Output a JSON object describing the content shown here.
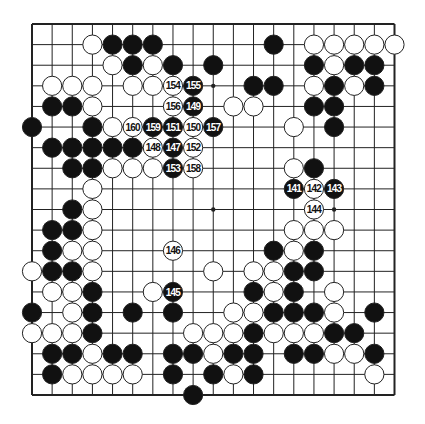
{
  "diagram": {
    "type": "go-board",
    "size": 19,
    "colors": {
      "board": "#ffffff",
      "line": "#222222",
      "black": "#111111",
      "white": "#ffffff",
      "label_on_black": "#ffffff",
      "label_on_white": "#111111"
    },
    "star_points": [
      [
        3,
        3
      ],
      [
        3,
        9
      ],
      [
        3,
        15
      ],
      [
        9,
        3
      ],
      [
        9,
        9
      ],
      [
        9,
        15
      ],
      [
        15,
        3
      ],
      [
        15,
        9
      ],
      [
        15,
        15
      ]
    ],
    "stones": [
      {
        "r": 1,
        "c": 3,
        "color": "W"
      },
      {
        "r": 1,
        "c": 4,
        "color": "B"
      },
      {
        "r": 1,
        "c": 5,
        "color": "B"
      },
      {
        "r": 1,
        "c": 6,
        "color": "B"
      },
      {
        "r": 1,
        "c": 12,
        "color": "B"
      },
      {
        "r": 1,
        "c": 14,
        "color": "W"
      },
      {
        "r": 1,
        "c": 15,
        "color": "W"
      },
      {
        "r": 1,
        "c": 16,
        "color": "W"
      },
      {
        "r": 1,
        "c": 17,
        "color": "W"
      },
      {
        "r": 1,
        "c": 18,
        "color": "W"
      },
      {
        "r": 2,
        "c": 4,
        "color": "W"
      },
      {
        "r": 2,
        "c": 5,
        "color": "B"
      },
      {
        "r": 2,
        "c": 6,
        "color": "W"
      },
      {
        "r": 2,
        "c": 7,
        "color": "B"
      },
      {
        "r": 2,
        "c": 9,
        "color": "B"
      },
      {
        "r": 2,
        "c": 14,
        "color": "B"
      },
      {
        "r": 2,
        "c": 15,
        "color": "W"
      },
      {
        "r": 2,
        "c": 16,
        "color": "B"
      },
      {
        "r": 2,
        "c": 17,
        "color": "B"
      },
      {
        "r": 3,
        "c": 1,
        "color": "W"
      },
      {
        "r": 3,
        "c": 2,
        "color": "W"
      },
      {
        "r": 3,
        "c": 3,
        "color": "W"
      },
      {
        "r": 3,
        "c": 5,
        "color": "W"
      },
      {
        "r": 3,
        "c": 6,
        "color": "W"
      },
      {
        "r": 3,
        "c": 7,
        "color": "W",
        "label": "154"
      },
      {
        "r": 3,
        "c": 8,
        "color": "B",
        "label": "155"
      },
      {
        "r": 3,
        "c": 11,
        "color": "B"
      },
      {
        "r": 3,
        "c": 12,
        "color": "B"
      },
      {
        "r": 3,
        "c": 14,
        "color": "W"
      },
      {
        "r": 3,
        "c": 15,
        "color": "B"
      },
      {
        "r": 3,
        "c": 16,
        "color": "W"
      },
      {
        "r": 3,
        "c": 17,
        "color": "B"
      },
      {
        "r": 4,
        "c": 1,
        "color": "B"
      },
      {
        "r": 4,
        "c": 2,
        "color": "B"
      },
      {
        "r": 4,
        "c": 3,
        "color": "W"
      },
      {
        "r": 4,
        "c": 7,
        "color": "W",
        "label": "156"
      },
      {
        "r": 4,
        "c": 8,
        "color": "B",
        "label": "149"
      },
      {
        "r": 4,
        "c": 10,
        "color": "W"
      },
      {
        "r": 4,
        "c": 11,
        "color": "W"
      },
      {
        "r": 4,
        "c": 14,
        "color": "B"
      },
      {
        "r": 4,
        "c": 15,
        "color": "B"
      },
      {
        "r": 5,
        "c": 0,
        "color": "B"
      },
      {
        "r": 5,
        "c": 3,
        "color": "B"
      },
      {
        "r": 5,
        "c": 4,
        "color": "W"
      },
      {
        "r": 5,
        "c": 5,
        "color": "W",
        "label": "160"
      },
      {
        "r": 5,
        "c": 6,
        "color": "B",
        "label": "159"
      },
      {
        "r": 5,
        "c": 7,
        "color": "B",
        "label": "151"
      },
      {
        "r": 5,
        "c": 8,
        "color": "W",
        "label": "150"
      },
      {
        "r": 5,
        "c": 9,
        "color": "B",
        "label": "157"
      },
      {
        "r": 5,
        "c": 13,
        "color": "W"
      },
      {
        "r": 5,
        "c": 15,
        "color": "B"
      },
      {
        "r": 6,
        "c": 1,
        "color": "B"
      },
      {
        "r": 6,
        "c": 2,
        "color": "B"
      },
      {
        "r": 6,
        "c": 3,
        "color": "B"
      },
      {
        "r": 6,
        "c": 4,
        "color": "B"
      },
      {
        "r": 6,
        "c": 5,
        "color": "B"
      },
      {
        "r": 6,
        "c": 6,
        "color": "W",
        "label": "148"
      },
      {
        "r": 6,
        "c": 7,
        "color": "B",
        "label": "147"
      },
      {
        "r": 6,
        "c": 8,
        "color": "W",
        "label": "152"
      },
      {
        "r": 7,
        "c": 2,
        "color": "B"
      },
      {
        "r": 7,
        "c": 3,
        "color": "B"
      },
      {
        "r": 7,
        "c": 4,
        "color": "W"
      },
      {
        "r": 7,
        "c": 5,
        "color": "W"
      },
      {
        "r": 7,
        "c": 6,
        "color": "W"
      },
      {
        "r": 7,
        "c": 7,
        "color": "B",
        "label": "153"
      },
      {
        "r": 7,
        "c": 8,
        "color": "W",
        "label": "158"
      },
      {
        "r": 7,
        "c": 13,
        "color": "W"
      },
      {
        "r": 7,
        "c": 14,
        "color": "B"
      },
      {
        "r": 8,
        "c": 3,
        "color": "W"
      },
      {
        "r": 8,
        "c": 13,
        "color": "B",
        "label": "141"
      },
      {
        "r": 8,
        "c": 14,
        "color": "W",
        "label": "142"
      },
      {
        "r": 8,
        "c": 15,
        "color": "B",
        "label": "143"
      },
      {
        "r": 9,
        "c": 2,
        "color": "B"
      },
      {
        "r": 9,
        "c": 3,
        "color": "W"
      },
      {
        "r": 9,
        "c": 14,
        "color": "W",
        "label": "144"
      },
      {
        "r": 10,
        "c": 1,
        "color": "B"
      },
      {
        "r": 10,
        "c": 2,
        "color": "B"
      },
      {
        "r": 10,
        "c": 3,
        "color": "W"
      },
      {
        "r": 10,
        "c": 13,
        "color": "W"
      },
      {
        "r": 10,
        "c": 14,
        "color": "W"
      },
      {
        "r": 10,
        "c": 15,
        "color": "W"
      },
      {
        "r": 11,
        "c": 1,
        "color": "B"
      },
      {
        "r": 11,
        "c": 2,
        "color": "W"
      },
      {
        "r": 11,
        "c": 3,
        "color": "W"
      },
      {
        "r": 11,
        "c": 7,
        "color": "W",
        "label": "146"
      },
      {
        "r": 11,
        "c": 12,
        "color": "B"
      },
      {
        "r": 11,
        "c": 13,
        "color": "W"
      },
      {
        "r": 11,
        "c": 14,
        "color": "B"
      },
      {
        "r": 12,
        "c": 0,
        "color": "W"
      },
      {
        "r": 12,
        "c": 1,
        "color": "B"
      },
      {
        "r": 12,
        "c": 2,
        "color": "B"
      },
      {
        "r": 12,
        "c": 3,
        "color": "W"
      },
      {
        "r": 12,
        "c": 9,
        "color": "W"
      },
      {
        "r": 12,
        "c": 11,
        "color": "W"
      },
      {
        "r": 12,
        "c": 12,
        "color": "W"
      },
      {
        "r": 12,
        "c": 13,
        "color": "B"
      },
      {
        "r": 12,
        "c": 14,
        "color": "B"
      },
      {
        "r": 13,
        "c": 1,
        "color": "W"
      },
      {
        "r": 13,
        "c": 2,
        "color": "W"
      },
      {
        "r": 13,
        "c": 3,
        "color": "B"
      },
      {
        "r": 13,
        "c": 6,
        "color": "W"
      },
      {
        "r": 13,
        "c": 7,
        "color": "B",
        "label": "145"
      },
      {
        "r": 13,
        "c": 11,
        "color": "B"
      },
      {
        "r": 13,
        "c": 12,
        "color": "W"
      },
      {
        "r": 13,
        "c": 13,
        "color": "B"
      },
      {
        "r": 13,
        "c": 15,
        "color": "W"
      },
      {
        "r": 14,
        "c": 0,
        "color": "B"
      },
      {
        "r": 14,
        "c": 2,
        "color": "W"
      },
      {
        "r": 14,
        "c": 3,
        "color": "B"
      },
      {
        "r": 14,
        "c": 5,
        "color": "B"
      },
      {
        "r": 14,
        "c": 7,
        "color": "B"
      },
      {
        "r": 14,
        "c": 10,
        "color": "W"
      },
      {
        "r": 14,
        "c": 11,
        "color": "W"
      },
      {
        "r": 14,
        "c": 12,
        "color": "B"
      },
      {
        "r": 14,
        "c": 13,
        "color": "B"
      },
      {
        "r": 14,
        "c": 14,
        "color": "B"
      },
      {
        "r": 14,
        "c": 15,
        "color": "W"
      },
      {
        "r": 14,
        "c": 17,
        "color": "B"
      },
      {
        "r": 15,
        "c": 0,
        "color": "W"
      },
      {
        "r": 15,
        "c": 1,
        "color": "W"
      },
      {
        "r": 15,
        "c": 2,
        "color": "W"
      },
      {
        "r": 15,
        "c": 3,
        "color": "B"
      },
      {
        "r": 15,
        "c": 8,
        "color": "W"
      },
      {
        "r": 15,
        "c": 9,
        "color": "W"
      },
      {
        "r": 15,
        "c": 10,
        "color": "W"
      },
      {
        "r": 15,
        "c": 11,
        "color": "B"
      },
      {
        "r": 15,
        "c": 12,
        "color": "W"
      },
      {
        "r": 15,
        "c": 13,
        "color": "W"
      },
      {
        "r": 15,
        "c": 14,
        "color": "W"
      },
      {
        "r": 15,
        "c": 15,
        "color": "B"
      },
      {
        "r": 15,
        "c": 16,
        "color": "B"
      },
      {
        "r": 16,
        "c": 1,
        "color": "B"
      },
      {
        "r": 16,
        "c": 2,
        "color": "B"
      },
      {
        "r": 16,
        "c": 3,
        "color": "W"
      },
      {
        "r": 16,
        "c": 4,
        "color": "B"
      },
      {
        "r": 16,
        "c": 5,
        "color": "B"
      },
      {
        "r": 16,
        "c": 7,
        "color": "B"
      },
      {
        "r": 16,
        "c": 8,
        "color": "B"
      },
      {
        "r": 16,
        "c": 9,
        "color": "W"
      },
      {
        "r": 16,
        "c": 10,
        "color": "B"
      },
      {
        "r": 16,
        "c": 11,
        "color": "B"
      },
      {
        "r": 16,
        "c": 13,
        "color": "B"
      },
      {
        "r": 16,
        "c": 14,
        "color": "B"
      },
      {
        "r": 16,
        "c": 15,
        "color": "W"
      },
      {
        "r": 16,
        "c": 16,
        "color": "W"
      },
      {
        "r": 16,
        "c": 17,
        "color": "B"
      },
      {
        "r": 17,
        "c": 1,
        "color": "B"
      },
      {
        "r": 17,
        "c": 2,
        "color": "W"
      },
      {
        "r": 17,
        "c": 3,
        "color": "W"
      },
      {
        "r": 17,
        "c": 4,
        "color": "W"
      },
      {
        "r": 17,
        "c": 5,
        "color": "W"
      },
      {
        "r": 17,
        "c": 7,
        "color": "B"
      },
      {
        "r": 17,
        "c": 9,
        "color": "B"
      },
      {
        "r": 17,
        "c": 10,
        "color": "W"
      },
      {
        "r": 17,
        "c": 11,
        "color": "B"
      },
      {
        "r": 17,
        "c": 17,
        "color": "W"
      },
      {
        "r": 18,
        "c": 8,
        "color": "B"
      }
    ]
  }
}
